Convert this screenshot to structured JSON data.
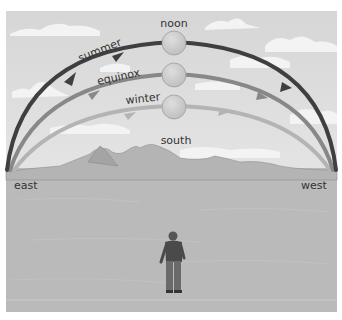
{
  "labels": {
    "noon": "noon",
    "summer": "summer",
    "equinox": "equinox",
    "winter": "winter",
    "south": "south",
    "east": "east",
    "west": "west"
  },
  "colors": {
    "sky": "#dcdcdc",
    "cloud": "#f2f2f2",
    "ground": "#b9b9b9",
    "mountain": "#a9a9a9",
    "summer_path": "#3e3e3e",
    "equinox_path": "#878787",
    "winter_path": "#b4b4b4",
    "sun": "#c8c8c8",
    "text": "#333333"
  }
}
